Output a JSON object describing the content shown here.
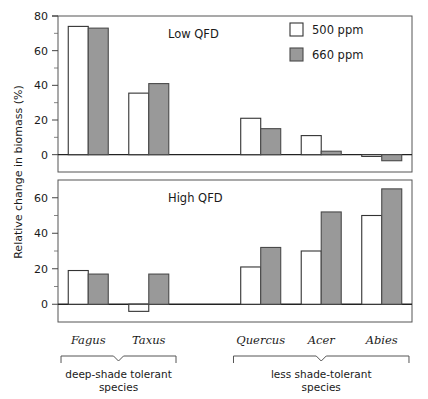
{
  "chart_data": {
    "type": "bar",
    "title": "",
    "xlabel": "",
    "ylabel": "Relative change in biomass (%)",
    "grid": false,
    "legend_position": "top-right",
    "legend": [
      {
        "name": "500 ppm",
        "style": "open",
        "color": "#ffffff"
      },
      {
        "name": "660 ppm",
        "style": "filled",
        "color": "#999999"
      }
    ],
    "categories": [
      "Fagus",
      "Taxus",
      "Quercus",
      "Acer",
      "Abies"
    ],
    "panels": [
      {
        "label": "Low QFD",
        "ylim": [
          -10,
          80
        ],
        "yticks": [
          0,
          20,
          40,
          60,
          80
        ],
        "yticks_minor": [
          10,
          30,
          50,
          70
        ],
        "series": [
          {
            "name": "500 ppm",
            "values": [
              74,
              35.5,
              21,
              11,
              -1
            ]
          },
          {
            "name": "660 ppm",
            "values": [
              73,
              41,
              15,
              2,
              -3.5
            ]
          }
        ]
      },
      {
        "label": "High QFD",
        "ylim": [
          -10,
          70
        ],
        "yticks": [
          0,
          20,
          40,
          60
        ],
        "yticks_minor": [
          10,
          30,
          50
        ],
        "series": [
          {
            "name": "500 ppm",
            "values": [
              19,
              -4,
              21,
              30,
              50
            ]
          },
          {
            "name": "660 ppm",
            "values": [
              17,
              17,
              32,
              52,
              65
            ]
          }
        ]
      }
    ],
    "groups": [
      {
        "label_line1": "deep-shade tolerant",
        "label_line2": "species",
        "members": [
          "Fagus",
          "Taxus"
        ]
      },
      {
        "label_line1": "less shade-tolerant",
        "label_line2": "species",
        "members": [
          "Quercus",
          "Acer",
          "Abies"
        ]
      }
    ]
  }
}
